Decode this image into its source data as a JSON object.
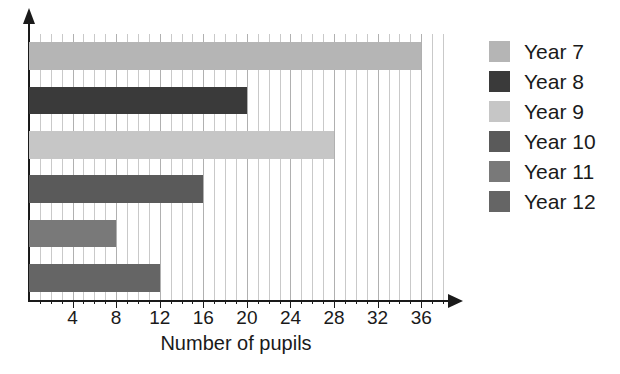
{
  "chart_data": {
    "type": "bar",
    "orientation": "horizontal",
    "title": "",
    "xlabel": "Number of pupils",
    "ylabel": "",
    "categories": [
      "Year 7",
      "Year 8",
      "Year 9",
      "Year 10",
      "Year 11",
      "Year 12"
    ],
    "values": [
      36,
      20,
      28,
      16,
      8,
      12
    ],
    "colors": [
      "#b5b5b5",
      "#3a3a3a",
      "#c6c6c6",
      "#5a5a5a",
      "#797979",
      "#656565"
    ],
    "xlim": [
      0,
      38
    ],
    "xticks": [
      4,
      8,
      12,
      16,
      20,
      24,
      28,
      32,
      36
    ],
    "xtick_labels": [
      "4",
      "8",
      "12",
      "16",
      "20",
      "24",
      "28",
      "32",
      "36"
    ],
    "minor_gridline_step": 1,
    "grid": true,
    "legend_position": "right",
    "legend_entries": [
      {
        "label": "Year 7",
        "color": "#b5b5b5",
        "value": 36
      },
      {
        "label": "Year 8",
        "color": "#3a3a3a",
        "value": 20
      },
      {
        "label": "Year 9",
        "color": "#c6c6c6",
        "value": 28
      },
      {
        "label": "Year 10",
        "color": "#5a5a5a",
        "value": 16
      },
      {
        "label": "Year 11",
        "color": "#797979",
        "value": 8
      },
      {
        "label": "Year 12",
        "color": "#656565",
        "value": 12
      }
    ]
  },
  "axis": {
    "x_title": "Number of pupils"
  },
  "title_fragment": ""
}
